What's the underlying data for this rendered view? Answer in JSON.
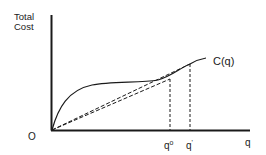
{
  "figure": {
    "y_axis_label_line1": "Total",
    "y_axis_label_line2": "Cost",
    "x_axis_label": "q",
    "origin_label": "O",
    "curve_label": "C(q)",
    "tick_labels": {
      "q0": "q",
      "q0_sup": "o",
      "q1": "q",
      "q1_sup": "'"
    },
    "colors": {
      "line": "#1a1a1a",
      "background": "#ffffff"
    }
  },
  "diagram": {
    "type": "cost-curve",
    "elements": [
      {
        "name": "y-axis",
        "label": "Total Cost"
      },
      {
        "name": "x-axis",
        "label": "q"
      },
      {
        "name": "cost-curve",
        "label": "C(q)",
        "shape": "rises steeply, flattens, then rises again"
      },
      {
        "name": "ray-to-q0",
        "style": "dashed"
      },
      {
        "name": "ray-to-q1",
        "style": "dashed"
      },
      {
        "name": "vertical-q0",
        "style": "dashed"
      },
      {
        "name": "vertical-q1",
        "style": "dashed"
      }
    ]
  }
}
